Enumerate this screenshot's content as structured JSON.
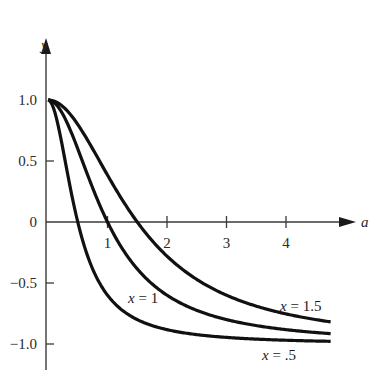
{
  "chart_data": {
    "type": "line",
    "title": "",
    "xlabel": "a",
    "ylabel": "y",
    "xlim": [
      0,
      4.75
    ],
    "ylim": [
      -1.2,
      1.45
    ],
    "grid": false,
    "legend_position": "inline labels on curves",
    "x_ticks": [
      1,
      2,
      3,
      4
    ],
    "x_tick_labels": [
      "1",
      "2",
      "3",
      "4"
    ],
    "y_ticks": [
      1.0,
      0.5,
      0,
      -0.5,
      -1.0
    ],
    "y_tick_labels": [
      "1.0",
      "0.5",
      "0",
      "−0.5",
      "−1.0"
    ],
    "x": [
      0,
      0.25,
      0.5,
      0.75,
      1.0,
      1.25,
      1.5,
      1.75,
      2.0,
      2.5,
      3.0,
      3.5,
      4.0,
      4.5,
      4.75
    ],
    "series": [
      {
        "name": "x = .5",
        "label": "x = .5",
        "param": 0.5,
        "values": [
          1.0,
          0.6,
          0.0,
          -0.38,
          -0.6,
          -0.72,
          -0.8,
          -0.85,
          -0.88,
          -0.92,
          -0.95,
          -0.96,
          -0.97,
          -0.98,
          -0.98
        ]
      },
      {
        "name": "x = 1",
        "label": "x = 1",
        "param": 1.0,
        "values": [
          1.0,
          0.88,
          0.6,
          0.28,
          0.0,
          -0.22,
          -0.38,
          -0.51,
          -0.6,
          -0.72,
          -0.8,
          -0.85,
          -0.88,
          -0.91,
          -0.91
        ]
      },
      {
        "name": "x = 1.5",
        "label": "x = 1.5",
        "param": 1.5,
        "values": [
          1.0,
          0.95,
          0.8,
          0.6,
          0.38,
          0.18,
          0.0,
          -0.15,
          -0.28,
          -0.47,
          -0.6,
          -0.69,
          -0.75,
          -0.8,
          -0.82
        ]
      }
    ],
    "annotations": [
      {
        "text": "x = 1",
        "near_series": "x = 1"
      },
      {
        "text": "x = 1.5",
        "near_series": "x = 1.5"
      },
      {
        "text": "x = .5",
        "near_series": "x = .5"
      }
    ]
  },
  "labels": {
    "x_axis": "a",
    "y_axis": "y",
    "curve_x1": {
      "var": "x",
      "rest": " = 1"
    },
    "curve_x15": {
      "var": "x",
      "rest": " = 1.5"
    },
    "curve_x05": {
      "var": "x",
      "rest": " = .5"
    }
  }
}
